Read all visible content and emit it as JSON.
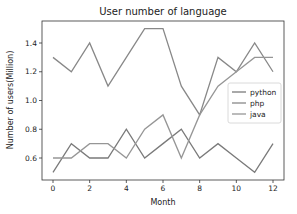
{
  "chart_data": {
    "type": "line",
    "title": "User number of language",
    "xlabel": "Month",
    "ylabel": "Number of users(Million)",
    "x": [
      0,
      1,
      2,
      3,
      4,
      5,
      6,
      7,
      8,
      9,
      10,
      11,
      12
    ],
    "xticks": [
      "0",
      "2",
      "4",
      "6",
      "8",
      "10",
      "12"
    ],
    "yticks": [
      "0.6",
      "0.8",
      "1.0",
      "1.2",
      "1.4"
    ],
    "xlim": [
      -0.6,
      12.6
    ],
    "ylim": [
      0.45,
      1.55
    ],
    "grid": false,
    "legend_position": "center right",
    "series": [
      {
        "name": "python",
        "color": "#7a7a7a",
        "values": [
          0.5,
          0.7,
          0.6,
          0.6,
          0.8,
          0.6,
          0.7,
          0.8,
          0.6,
          0.7,
          0.6,
          0.5,
          0.7
        ]
      },
      {
        "name": "php",
        "color": "#888888",
        "values": [
          1.3,
          1.2,
          1.4,
          1.1,
          1.3,
          1.5,
          1.5,
          1.1,
          0.9,
          1.3,
          1.2,
          1.4,
          1.2
        ]
      },
      {
        "name": "java",
        "color": "#969696",
        "values": [
          0.6,
          0.6,
          0.7,
          0.7,
          0.6,
          0.8,
          0.9,
          0.6,
          0.9,
          1.1,
          1.2,
          1.3,
          1.3
        ]
      }
    ]
  }
}
